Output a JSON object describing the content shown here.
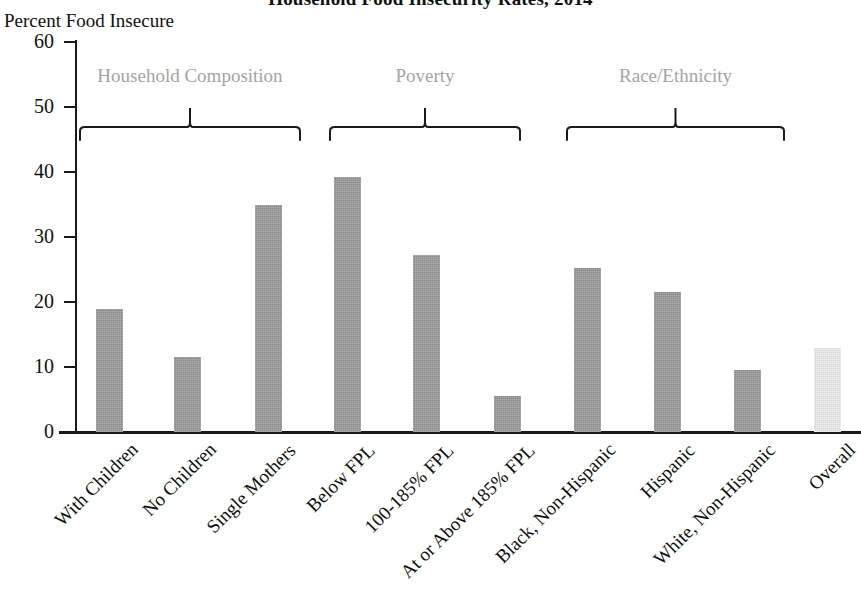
{
  "chart_data": {
    "type": "bar",
    "title": "Household Food Insecurity Rates, 2014",
    "xlabel": "",
    "ylabel": "Percent Food Insecure",
    "ylim": [
      0,
      60
    ],
    "ytick_labels": [
      "60",
      "50",
      "40",
      "30",
      "20",
      "10",
      "0"
    ],
    "ytick_values": [
      60,
      50,
      40,
      30,
      20,
      10,
      0
    ],
    "grid": false,
    "legend": "none",
    "categories": [
      "With Children",
      "No Children",
      "Single Mothers",
      "Below FPL",
      "100-185% FPL",
      "At or Above 185% FPL",
      "Black, Non-Hispanic",
      "Hispanic",
      "White, Non-Hispanic",
      "Overall"
    ],
    "values": [
      19.0,
      11.5,
      35.0,
      39.3,
      27.3,
      5.6,
      25.3,
      21.6,
      9.6,
      12.9
    ],
    "bar_colors": [
      "#9a9a9a",
      "#9a9a9a",
      "#9a9a9a",
      "#9a9a9a",
      "#9a9a9a",
      "#9a9a9a",
      "#9a9a9a",
      "#9a9a9a",
      "#9a9a9a",
      "#e3e3e3"
    ],
    "groups": [
      {
        "label": "Household Composition",
        "categories": [
          "With Children",
          "No Children",
          "Single Mothers"
        ]
      },
      {
        "label": "Poverty",
        "categories": [
          "Below FPL",
          "100-185% FPL",
          "At or Above 185% FPL"
        ]
      },
      {
        "label": "Race/Ethnicity",
        "categories": [
          "Black, Non-Hispanic",
          "Hispanic",
          "White, Non-Hispanic"
        ]
      }
    ],
    "accent_color": "#9a9a9a",
    "highlight_color": "#e3e3e3",
    "group_label_color": "#a4a4a4",
    "axis_color": "#1a1a1a"
  }
}
